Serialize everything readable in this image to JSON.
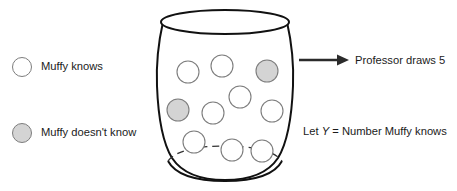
{
  "diagram": {
    "legend": {
      "items": [
        {
          "label": "Muffy knows",
          "swatch": "white-circle",
          "color": "#ffffff"
        },
        {
          "label": "Muffy doesn't know",
          "swatch": "gray-circle",
          "color": "#d4d4d4"
        }
      ]
    },
    "arrow": {
      "icon": "right-arrow-icon",
      "label": "Professor draws 5",
      "draws": 5
    },
    "definition": {
      "prefix": "Let",
      "variable": "Y",
      "equals": "=",
      "description": "Number Muffy knows",
      "full_text": "Let Y = Number Muffy knows"
    },
    "urn": {
      "name": "vase",
      "stroke": "#111111",
      "fill": "#ffffff",
      "total_balls": 10,
      "known_count": 8,
      "unknown_count": 2,
      "balls": [
        {
          "id": 1,
          "cx": 188,
          "cy": 72,
          "r": 11,
          "state": "knows",
          "fill": "#ffffff"
        },
        {
          "id": 2,
          "cx": 222,
          "cy": 66,
          "r": 11,
          "state": "knows",
          "fill": "#ffffff"
        },
        {
          "id": 3,
          "cx": 267,
          "cy": 71,
          "r": 11,
          "state": "doesnt-know",
          "fill": "#d4d4d4"
        },
        {
          "id": 4,
          "cx": 240,
          "cy": 97,
          "r": 11,
          "state": "knows",
          "fill": "#ffffff"
        },
        {
          "id": 5,
          "cx": 178,
          "cy": 110,
          "r": 11,
          "state": "doesnt-know",
          "fill": "#d4d4d4"
        },
        {
          "id": 6,
          "cx": 213,
          "cy": 113,
          "r": 11,
          "state": "knows",
          "fill": "#ffffff"
        },
        {
          "id": 7,
          "cx": 272,
          "cy": 111,
          "r": 11,
          "state": "knows",
          "fill": "#ffffff"
        },
        {
          "id": 8,
          "cx": 194,
          "cy": 142,
          "r": 11,
          "state": "knows",
          "fill": "#ffffff"
        },
        {
          "id": 9,
          "cx": 232,
          "cy": 150,
          "r": 11,
          "state": "knows",
          "fill": "#ffffff"
        },
        {
          "id": 10,
          "cx": 262,
          "cy": 151,
          "r": 11,
          "state": "knows",
          "fill": "#ffffff"
        }
      ]
    }
  }
}
